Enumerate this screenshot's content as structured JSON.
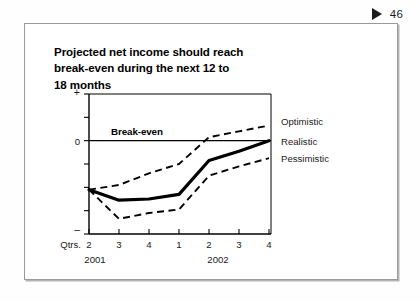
{
  "page_marker": {
    "icon": "play-triangle-icon",
    "number": "46"
  },
  "card": {
    "title_lines": [
      "Projected net income should reach",
      "break-even during the next 12 to",
      "18 months"
    ]
  },
  "chart_data": {
    "type": "line",
    "title": "Projected net income should reach break-even during the next 12 to 18 months",
    "xlabel": "Qtrs.",
    "ylabel": "",
    "x_axis_prefix_label": "Qtrs.",
    "categories": [
      "2",
      "3",
      "4",
      "1",
      "2",
      "3",
      "4"
    ],
    "year_groups": [
      {
        "label": "2001",
        "start_index": 0,
        "end_index": 2
      },
      {
        "label": "2002",
        "start_index": 3,
        "end_index": 6
      }
    ],
    "y_axis_labels": {
      "top": "+",
      "zero": "0",
      "bottom": "–"
    },
    "ylim": [
      -4,
      2
    ],
    "y_ticks": [
      2,
      1,
      0,
      -1,
      -2,
      -3,
      -4
    ],
    "grid": false,
    "zero_line": true,
    "zero_annotation": "Break-even",
    "legend_position": "right",
    "series": [
      {
        "name": "Optimistic",
        "style": "dashed",
        "values": [
          -2.1,
          -1.9,
          -1.4,
          -1.0,
          0.15,
          0.4,
          0.65
        ]
      },
      {
        "name": "Realistic",
        "style": "solid-thick",
        "values": [
          -2.1,
          -2.55,
          -2.5,
          -2.3,
          -0.85,
          -0.45,
          0.0
        ]
      },
      {
        "name": "Pessimistic",
        "style": "dashed",
        "values": [
          -2.1,
          -3.35,
          -3.1,
          -2.95,
          -1.5,
          -1.1,
          -0.75
        ]
      }
    ]
  }
}
